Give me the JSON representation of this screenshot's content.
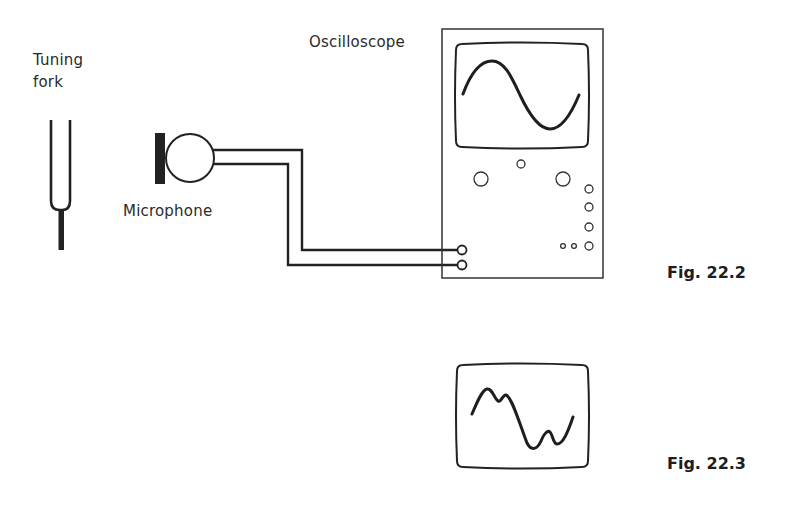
{
  "figure_22_2": {
    "caption": "Fig. 22.2",
    "labels": {
      "tuning_fork_line1": "Tuning",
      "tuning_fork_line2": "fork",
      "microphone": "Microphone",
      "oscilloscope": "Oscilloscope"
    },
    "components": [
      {
        "name": "tuning-fork",
        "icon": "tuning-fork-icon"
      },
      {
        "name": "microphone",
        "icon": "microphone-icon"
      },
      {
        "name": "connecting-wires",
        "count": 2
      },
      {
        "name": "oscilloscope",
        "display": "single sine wave, ~1 cycle"
      }
    ],
    "oscilloscope_controls": {
      "large_knobs": 2,
      "small_top_knob": 1,
      "right_column_knobs": 4,
      "tiny_knobs": 2,
      "input_terminals": 2
    }
  },
  "figure_22_3": {
    "caption": "Fig. 22.3",
    "display": "distorted waveform with harmonics (sine with secondary ripples)"
  },
  "colors": {
    "ink": "#222222",
    "background": "#ffffff"
  }
}
